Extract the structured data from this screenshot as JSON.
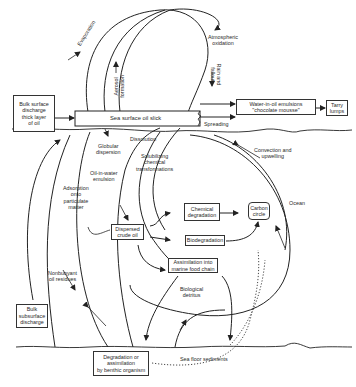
{
  "diagram": {
    "boxes": {
      "bulk_surface": [
        "Bulk surface",
        "discharge",
        "thick layer",
        "of oil"
      ],
      "oil_slick": "Sea surface oil slick",
      "emulsion": [
        "Water-in-oil emulsions",
        "\"chocolate mousse\""
      ],
      "tarry": [
        "Tarry",
        "lumps"
      ],
      "dispersed": [
        "Dispersed",
        "crude oil"
      ],
      "chem_deg": [
        "Chemical",
        "degradation"
      ],
      "biodeg": "Biodegradation",
      "carbon": [
        "Carbon",
        "circle"
      ],
      "assimilation": [
        "Assimilation into",
        "marine food chain"
      ],
      "bulk_subsurface": [
        "Bulk",
        "subsurface",
        "discharge"
      ],
      "benthic": [
        "Degradation or",
        "assimilation",
        "by benthic organism"
      ]
    },
    "labels": {
      "evaporation": "Evaporation",
      "aerosol": [
        "Aerosol",
        "formation"
      ],
      "atmospheric": [
        "Atmospheric",
        "oxidation"
      ],
      "rain": [
        "Rain and",
        "fallout"
      ],
      "spreading": "Spreading",
      "globular": [
        "Globular",
        "dispersion"
      ],
      "dissolution": "Dissolution",
      "solubilizing": [
        "Solubilizing",
        "chemical",
        "transformations"
      ],
      "oil_in_water": [
        "Oil-in-water",
        "emulsion"
      ],
      "adsorption": [
        "Adsorption",
        "onto",
        "particulate",
        "matter"
      ],
      "convection": [
        "Convection and",
        "upwelling"
      ],
      "ocean": "Ocean",
      "nonbuoyant": [
        "Nonbuoyant",
        "oil residues"
      ],
      "biological": [
        "Biological",
        "detritus"
      ],
      "sediments": "Sea floor sediments"
    }
  }
}
